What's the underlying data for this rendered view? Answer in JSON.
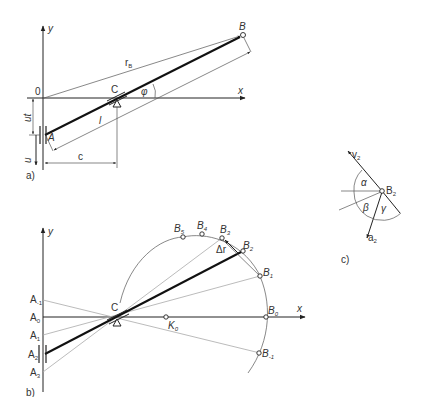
{
  "figure": {
    "panels": [
      {
        "id": "a",
        "caption": "a)",
        "axes": {
          "x": "x",
          "y": "y",
          "origin": "0"
        },
        "points": {
          "A": "A",
          "B": "B",
          "C": "C"
        },
        "vectors": {
          "rB": "r",
          "rB_sub": "B"
        },
        "dimensions": {
          "length": "l",
          "offset": "c",
          "displacement": "ut",
          "velocity": "u"
        },
        "angle": "φ"
      },
      {
        "id": "b",
        "caption": "b)",
        "axes": {
          "x": "x",
          "y": "y"
        },
        "pivot": "C",
        "slider_positions": [
          {
            "label": "A",
            "sub": "-1"
          },
          {
            "label": "A",
            "sub": "0"
          },
          {
            "label": "A",
            "sub": "1"
          },
          {
            "label": "A",
            "sub": "2"
          },
          {
            "label": "A",
            "sub": "3"
          }
        ],
        "curve_points": [
          {
            "label": "B",
            "sub": "5"
          },
          {
            "label": "B",
            "sub": "4"
          },
          {
            "label": "B",
            "sub": "3"
          },
          {
            "label": "B",
            "sub": "2"
          },
          {
            "label": "B",
            "sub": "1"
          },
          {
            "label": "B",
            "sub": "0"
          },
          {
            "label": "B",
            "sub": "-1"
          }
        ],
        "center_point": {
          "label": "K",
          "sub": "0"
        },
        "delta": "Δr"
      },
      {
        "id": "c",
        "caption": "c)",
        "point": {
          "label": "B",
          "sub": "2"
        },
        "velocity": {
          "label": "v",
          "sub": "2"
        },
        "acceleration": {
          "label": "a",
          "sub": "2"
        },
        "angles": [
          "α",
          "β",
          "γ"
        ]
      }
    ]
  }
}
